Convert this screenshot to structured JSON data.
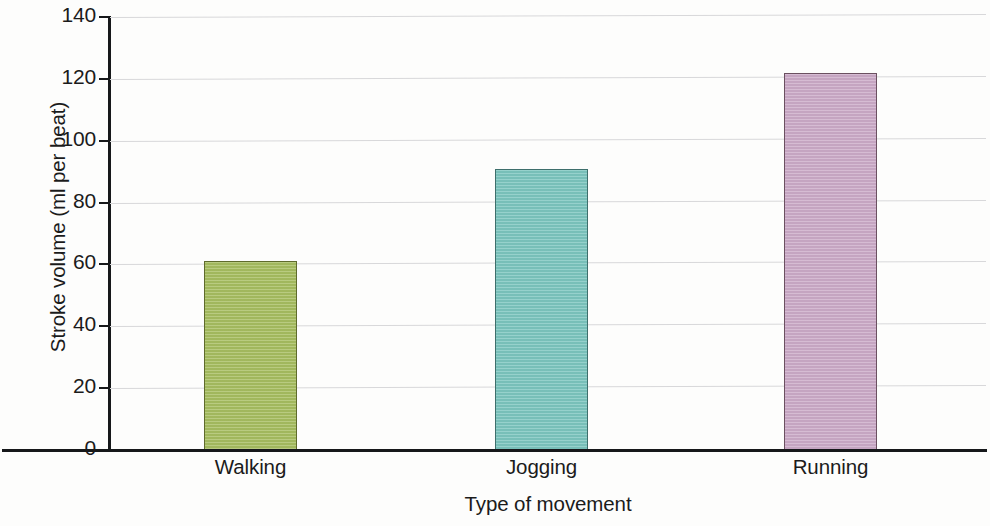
{
  "chart_data": {
    "type": "bar",
    "title": "",
    "xlabel": "Type of movement",
    "ylabel": "Stroke volume (ml per beat)",
    "categories": [
      "Walking",
      "Jogging",
      "Running"
    ],
    "values": [
      61,
      91,
      122
    ],
    "ylim": [
      0,
      140
    ],
    "ytick_labels": [
      "0",
      "20",
      "40",
      "60",
      "80",
      "100",
      "120",
      "140"
    ],
    "ytick_values": [
      0,
      20,
      40,
      60,
      80,
      100,
      120,
      140
    ],
    "grid": true,
    "legend": "none",
    "series": [
      {
        "name": "Stroke volume",
        "values": [
          61,
          91,
          122
        ]
      }
    ],
    "bar_colors": [
      "#a7be60",
      "#7cc6bf",
      "#ccabc8"
    ],
    "bar_border_colors": [
      "#5f6b2c",
      "#3e6f6c",
      "#6b5060"
    ]
  }
}
